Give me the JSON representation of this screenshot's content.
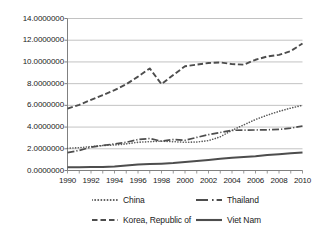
{
  "chart_data": {
    "type": "line",
    "title": "",
    "xlabel": "",
    "ylabel": "",
    "xlim": [
      1990,
      2010
    ],
    "ylim": [
      0,
      14
    ],
    "grid": true,
    "grid_axis": "y",
    "legend_position": "bottom",
    "x": [
      1990,
      1991,
      1992,
      1993,
      1994,
      1995,
      1996,
      1997,
      1998,
      1999,
      2000,
      2001,
      2002,
      2003,
      2004,
      2005,
      2006,
      2007,
      2008,
      2009,
      2010
    ],
    "y_ticks": [
      0,
      2,
      4,
      6,
      8,
      10,
      12,
      14
    ],
    "y_tick_labels": [
      "0.0000000",
      "2.0000000",
      "4.0000000",
      "6.0000000",
      "8.0000000",
      "10.0000000",
      "12.0000000",
      "14.0000000"
    ],
    "x_ticks": [
      1990,
      1992,
      1994,
      1996,
      1998,
      2000,
      2002,
      2004,
      2006,
      2008,
      2010
    ],
    "x_tick_labels": [
      "1990",
      "1992",
      "1994",
      "1996",
      "1998",
      "2000",
      "2002",
      "2004",
      "2006",
      "2008",
      "2010"
    ],
    "series": [
      {
        "name": "China",
        "style": "dotted",
        "color": "#595959",
        "width": 1.6,
        "dasharray": "0.1,2.6",
        "values": [
          2.05,
          2.1,
          2.2,
          2.3,
          2.35,
          2.45,
          2.6,
          2.65,
          2.7,
          2.65,
          2.6,
          2.62,
          2.75,
          3.1,
          3.7,
          4.2,
          4.7,
          5.1,
          5.45,
          5.75,
          6.0
        ]
      },
      {
        "name": "Thailand",
        "style": "dash-dot",
        "color": "#4d4d4d",
        "width": 1.7,
        "dasharray": "7,2,1.2,2",
        "values": [
          1.65,
          1.85,
          2.15,
          2.3,
          2.45,
          2.6,
          2.85,
          2.95,
          2.7,
          2.85,
          2.78,
          3.05,
          3.3,
          3.5,
          3.7,
          3.72,
          3.73,
          3.75,
          3.78,
          3.9,
          4.1
        ]
      },
      {
        "name": "Korea, Republic of",
        "style": "dashed",
        "color": "#4d4d4d",
        "width": 1.9,
        "dasharray": "5.5,2.6",
        "values": [
          5.7,
          6.05,
          6.5,
          6.95,
          7.4,
          7.95,
          8.65,
          9.4,
          7.95,
          8.8,
          9.6,
          9.75,
          9.9,
          9.95,
          9.8,
          9.75,
          10.2,
          10.5,
          10.65,
          11.0,
          11.7
        ]
      },
      {
        "name": "Viet Nam",
        "style": "solid",
        "color": "#4d4d4d",
        "width": 2.0,
        "dasharray": "",
        "values": [
          0.3,
          0.3,
          0.32,
          0.33,
          0.36,
          0.45,
          0.55,
          0.6,
          0.63,
          0.68,
          0.78,
          0.88,
          0.97,
          1.08,
          1.18,
          1.25,
          1.32,
          1.42,
          1.5,
          1.58,
          1.65
        ]
      }
    ]
  },
  "axes": {
    "axis_color": "#808080",
    "grid_color": "#b3b3b3",
    "tick_color": "#808080"
  },
  "legend": {
    "items": [
      {
        "label": "China",
        "key": "china"
      },
      {
        "label": "Thailand",
        "key": "thailand"
      },
      {
        "label": "Korea, Republic of",
        "key": "korea"
      },
      {
        "label": "Viet Nam",
        "key": "vietnam"
      }
    ]
  }
}
